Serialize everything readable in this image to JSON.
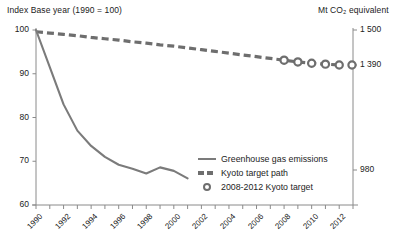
{
  "header": {
    "left": "Index Base year (1990 = 100)",
    "right": "Mt CO₂ equivalent"
  },
  "legend": {
    "items": [
      {
        "label": "Greenhouse gas emissions",
        "mark": "solid-line-swatch"
      },
      {
        "label": "Kyoto target path",
        "mark": "dashed-line-swatch"
      },
      {
        "label": "2008-2012 Kyoto target",
        "mark": "circle-marker-swatch"
      }
    ]
  },
  "colors": {
    "emissions_line": "#7b7b7b",
    "target_path": "#6e6e6e",
    "marker": "#6e6e6e",
    "axis": "#8a8a8a",
    "text": "#222222"
  },
  "chart_data": {
    "type": "line",
    "title": "",
    "xlabel": "",
    "ylabel": "Index Base year (1990 = 100)",
    "y2label": "Mt CO₂ equivalent",
    "grid": false,
    "legend_position": "inside-bottom-right",
    "xlim": [
      1990,
      2013
    ],
    "ylim": [
      60,
      100
    ],
    "y2lim": [
      700,
      1500
    ],
    "xticks": [
      1990,
      1991,
      1992,
      1993,
      1994,
      1995,
      1996,
      1997,
      1998,
      1999,
      2000,
      2001,
      2002,
      2003,
      2004,
      2005,
      2006,
      2007,
      2008,
      2009,
      2010,
      2011,
      2012,
      2013
    ],
    "xticklabels": [
      "1990",
      "",
      "1992",
      "",
      "1994",
      "",
      "1996",
      "",
      "1998",
      "",
      "2000",
      "",
      "2002",
      "",
      "2004",
      "",
      "2006",
      "",
      "2008",
      "",
      "2010",
      "",
      "2012",
      ""
    ],
    "yticks": [
      60,
      70,
      80,
      90,
      100
    ],
    "yticklabels": [
      "60",
      "70",
      "80",
      "90",
      "100"
    ],
    "y2ticks": [
      1500,
      1390,
      980
    ],
    "y2ticklabels": [
      "1 500",
      "1 390",
      "980"
    ],
    "series": [
      {
        "name": "Greenhouse gas emissions",
        "style": "solid",
        "color": "#7b7b7b",
        "x": [
          1990,
          1991,
          1992,
          1993,
          1994,
          1995,
          1996,
          1997,
          1998,
          1999,
          2000,
          2001
        ],
        "values": [
          100.0,
          91.5,
          83.0,
          77.0,
          73.5,
          71.0,
          69.2,
          68.3,
          67.2,
          68.6,
          67.8,
          66.1
        ]
      },
      {
        "name": "Kyoto target path",
        "style": "dashed",
        "color": "#6e6e6e",
        "x": [
          1990,
          1991,
          1992,
          1993,
          1994,
          1995,
          1996,
          1997,
          1998,
          1999,
          2000,
          2001,
          2002,
          2003,
          2004,
          2005,
          2006,
          2007,
          2008,
          2009,
          2010,
          2011,
          2012
        ],
        "values": [
          99.6,
          99.3,
          99.0,
          98.7,
          98.3,
          98.0,
          97.7,
          97.3,
          97.0,
          96.6,
          96.3,
          95.9,
          95.5,
          95.1,
          94.7,
          94.3,
          93.9,
          93.5,
          93.1,
          92.7,
          92.4,
          92.2,
          92.0
        ]
      },
      {
        "name": "2008-2012 Kyoto target",
        "style": "markers",
        "color": "#6e6e6e",
        "x": [
          2008,
          2009,
          2010,
          2011,
          2012
        ],
        "values": [
          93.1,
          92.7,
          92.4,
          92.2,
          92.0
        ]
      }
    ]
  }
}
